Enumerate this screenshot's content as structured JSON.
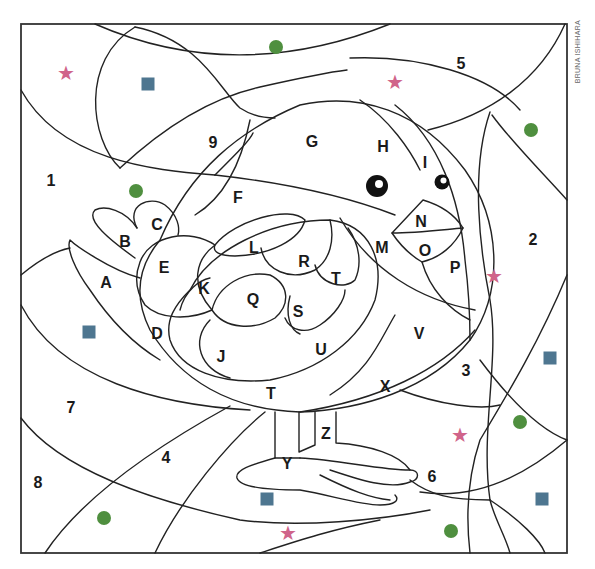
{
  "credit": "BRUNA ISHIHARA",
  "colors": {
    "star": "#d0648a",
    "square": "#4e7690",
    "circle": "#4f8f3f",
    "line": "#222222"
  },
  "number_labels": [
    {
      "text": "1",
      "x": 51,
      "y": 181
    },
    {
      "text": "2",
      "x": 533,
      "y": 240
    },
    {
      "text": "3",
      "x": 466,
      "y": 371
    },
    {
      "text": "4",
      "x": 166,
      "y": 458
    },
    {
      "text": "5",
      "x": 461,
      "y": 64
    },
    {
      "text": "6",
      "x": 432,
      "y": 477
    },
    {
      "text": "7",
      "x": 71,
      "y": 408
    },
    {
      "text": "8",
      "x": 38,
      "y": 483
    },
    {
      "text": "9",
      "x": 213,
      "y": 143
    }
  ],
  "letter_labels": [
    {
      "text": "A",
      "x": 106,
      "y": 283
    },
    {
      "text": "B",
      "x": 125,
      "y": 242
    },
    {
      "text": "C",
      "x": 157,
      "y": 225
    },
    {
      "text": "D",
      "x": 157,
      "y": 334
    },
    {
      "text": "E",
      "x": 164,
      "y": 268
    },
    {
      "text": "F",
      "x": 238,
      "y": 198
    },
    {
      "text": "G",
      "x": 312,
      "y": 142
    },
    {
      "text": "H",
      "x": 383,
      "y": 147
    },
    {
      "text": "I",
      "x": 425,
      "y": 163
    },
    {
      "text": "J",
      "x": 221,
      "y": 357
    },
    {
      "text": "K",
      "x": 204,
      "y": 289
    },
    {
      "text": "L",
      "x": 254,
      "y": 248
    },
    {
      "text": "M",
      "x": 382,
      "y": 248
    },
    {
      "text": "N",
      "x": 421,
      "y": 222
    },
    {
      "text": "O",
      "x": 425,
      "y": 251
    },
    {
      "text": "P",
      "x": 455,
      "y": 268
    },
    {
      "text": "Q",
      "x": 253,
      "y": 300
    },
    {
      "text": "R",
      "x": 304,
      "y": 262
    },
    {
      "text": "S",
      "x": 298,
      "y": 312
    },
    {
      "text": "T",
      "x": 336,
      "y": 279
    },
    {
      "text": "T",
      "x": 271,
      "y": 394
    },
    {
      "text": "U",
      "x": 321,
      "y": 350
    },
    {
      "text": "V",
      "x": 419,
      "y": 334
    },
    {
      "text": "X",
      "x": 385,
      "y": 387
    },
    {
      "text": "Y",
      "x": 287,
      "y": 464
    },
    {
      "text": "Z",
      "x": 326,
      "y": 434
    }
  ],
  "markers": [
    {
      "shape": "star",
      "x": 66,
      "y": 73
    },
    {
      "shape": "square",
      "x": 148,
      "y": 84
    },
    {
      "shape": "circle",
      "x": 276,
      "y": 47
    },
    {
      "shape": "star",
      "x": 395,
      "y": 82
    },
    {
      "shape": "circle",
      "x": 531,
      "y": 130
    },
    {
      "shape": "circle",
      "x": 136,
      "y": 191
    },
    {
      "shape": "star",
      "x": 494,
      "y": 276
    },
    {
      "shape": "square",
      "x": 89,
      "y": 332
    },
    {
      "shape": "square",
      "x": 550,
      "y": 358
    },
    {
      "shape": "circle",
      "x": 520,
      "y": 422
    },
    {
      "shape": "star",
      "x": 460,
      "y": 435
    },
    {
      "shape": "square",
      "x": 267,
      "y": 499
    },
    {
      "shape": "square",
      "x": 542,
      "y": 499
    },
    {
      "shape": "circle",
      "x": 104,
      "y": 518
    },
    {
      "shape": "star",
      "x": 288,
      "y": 533
    },
    {
      "shape": "circle",
      "x": 451,
      "y": 531
    }
  ],
  "eyes": [
    {
      "size": "big",
      "x": 377,
      "y": 186
    },
    {
      "size": "small",
      "x": 442,
      "y": 182
    }
  ],
  "glyphs": {
    "star": "★"
  }
}
